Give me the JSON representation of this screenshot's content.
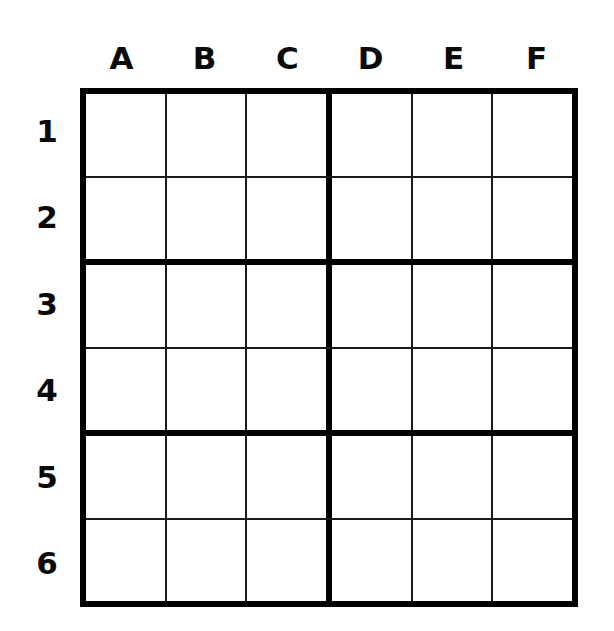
{
  "puzzle": {
    "kind": "sudoku-grid",
    "title": "",
    "columns": 6,
    "rows": 6,
    "box_width": 3,
    "box_height": 2,
    "background_color": "#ffffff",
    "line_color": "#1a1a1a",
    "border_color": "#000000",
    "text_color": "#000000",
    "column_labels": [
      "A",
      "B",
      "C",
      "D",
      "E",
      "F"
    ],
    "row_labels": [
      "1",
      "2",
      "3",
      "4",
      "5",
      "6"
    ],
    "cells": [
      [
        "",
        "",
        "",
        "",
        "",
        ""
      ],
      [
        "",
        "",
        "",
        "",
        "",
        ""
      ],
      [
        "",
        "",
        "",
        "",
        "",
        ""
      ],
      [
        "",
        "",
        "",
        "",
        "",
        ""
      ],
      [
        "",
        "",
        "",
        "",
        "",
        ""
      ],
      [
        "",
        "",
        "",
        "",
        "",
        ""
      ]
    ]
  }
}
